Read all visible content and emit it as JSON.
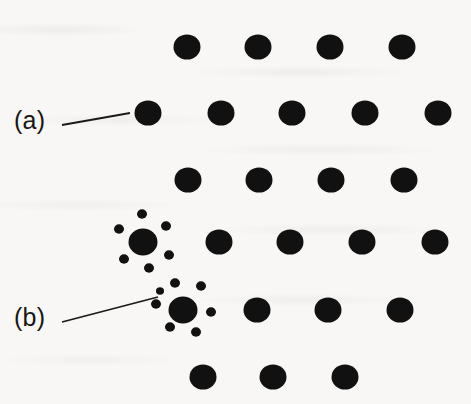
{
  "figure": {
    "kind": "lattice-diagram",
    "background_color": "#f8f7f5",
    "dot_color": "#111111",
    "leader_line_color": "#1a1a1a",
    "width": 471,
    "height": 404
  },
  "annotations": [
    {
      "id": "a",
      "label": "(a)",
      "label_x": 14,
      "label_y": 108,
      "meaning": "plain-lattice-site",
      "leader": {
        "x1": 62,
        "y1": 125,
        "x2": 130,
        "y2": 113
      }
    },
    {
      "id": "b",
      "label": "(b)",
      "label_x": 14,
      "label_y": 305,
      "meaning": "cluster-site",
      "leader": {
        "x1": 62,
        "y1": 322,
        "x2": 158,
        "y2": 297
      }
    }
  ],
  "lattice": {
    "dot_radius": 13.5,
    "cluster_center_radius": 14.5,
    "satellite_radius": 5,
    "rows": [
      {
        "name": "row-1",
        "y": 47,
        "dots": [
          187,
          258,
          330,
          402
        ]
      },
      {
        "name": "row-2",
        "y": 113,
        "dots": [
          148,
          221,
          292,
          365,
          438
        ]
      },
      {
        "name": "row-3",
        "y": 180,
        "dots": [
          188,
          259,
          331,
          404
        ]
      },
      {
        "name": "row-4",
        "y": 242,
        "dots": [
          219,
          290,
          362,
          435
        ]
      },
      {
        "name": "row-5",
        "y": 310,
        "dots": [
          257,
          328,
          400
        ]
      },
      {
        "name": "row-6",
        "y": 377,
        "dots": [
          203,
          273,
          345
        ]
      }
    ],
    "clusters": [
      {
        "name": "cluster-a",
        "cx": 143,
        "cy": 242,
        "satellites": [
          {
            "x": 142,
            "y": 214,
            "r": 5
          },
          {
            "x": 166,
            "y": 226,
            "r": 5
          },
          {
            "x": 169,
            "y": 255,
            "r": 5
          },
          {
            "x": 149,
            "y": 268,
            "r": 5
          },
          {
            "x": 124,
            "y": 259,
            "r": 5
          },
          {
            "x": 119,
            "y": 229,
            "r": 5
          }
        ]
      },
      {
        "name": "cluster-b",
        "cx": 183,
        "cy": 310,
        "satellites": [
          {
            "x": 175,
            "y": 283,
            "r": 5
          },
          {
            "x": 201,
            "y": 286,
            "r": 5
          },
          {
            "x": 211,
            "y": 312,
            "r": 5
          },
          {
            "x": 196,
            "y": 332,
            "r": 5
          },
          {
            "x": 170,
            "y": 327,
            "r": 5
          },
          {
            "x": 156,
            "y": 304,
            "r": 5
          },
          {
            "x": 160,
            "y": 291,
            "r": 4
          }
        ]
      }
    ]
  }
}
